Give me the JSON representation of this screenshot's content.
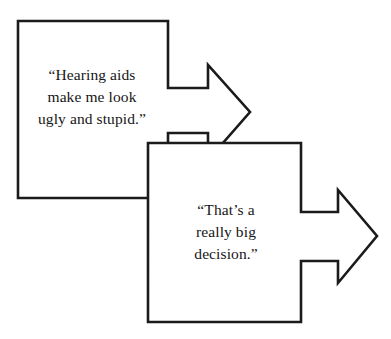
{
  "canvas": {
    "width": 391,
    "height": 339,
    "background_color": "#ffffff",
    "stroke_color": "#1b1b1b",
    "fill_color": "#ffffff"
  },
  "diagram": {
    "type": "overlapping-block-arrows",
    "arrow_count": 2,
    "arrows": [
      {
        "id": "arrow-one",
        "direction": "right",
        "label": "“Hearing aids\nmake me look\nugly and stupid.”",
        "label_lines": [
          "“Hearing aids",
          "make me look",
          "ugly and stupid.”"
        ]
      },
      {
        "id": "arrow-two",
        "direction": "right",
        "label": "“That’s a\nreally big\ndecision.”",
        "label_lines": [
          "“That’s a",
          "really big",
          "decision.”"
        ]
      }
    ]
  },
  "shapes": {
    "arrow_one_points": "18,21 168,21 168,88 208,88 208,65 250,112 208,160 208,133 168,133 168,198 18,198",
    "arrow_two_points": "148,143 301,143 301,212 338,212 338,190 377,236 338,283 338,261 301,261 301,322 148,322"
  }
}
